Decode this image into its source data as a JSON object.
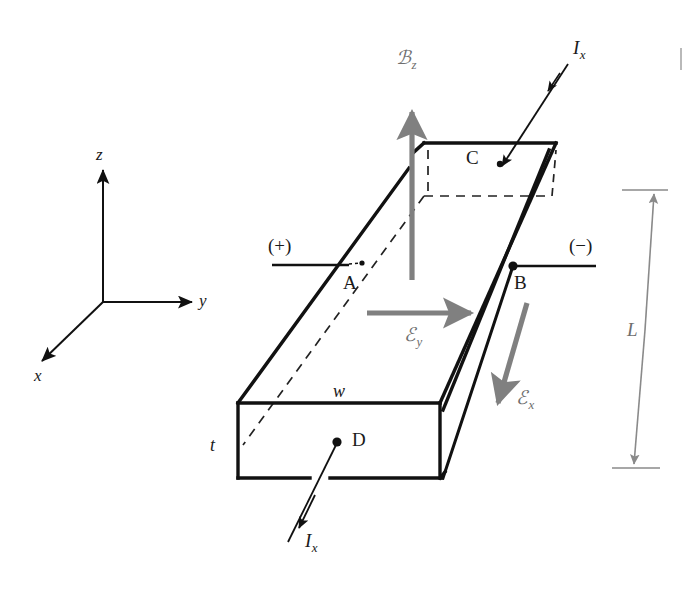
{
  "figure": {
    "background": "#ffffff",
    "width": 693,
    "height": 591
  },
  "colors": {
    "outline": "#111111",
    "hidden_edge": "#222222",
    "field_arrow": "#808080",
    "dimension": "#8a8a8a",
    "text": "#1a1a1a",
    "gray_text": "#6e6e6e"
  },
  "axes": {
    "name": "coordinate-axes",
    "origin": {
      "x": 103,
      "y": 302
    },
    "labels": {
      "z": "z",
      "y": "y",
      "x": "x"
    }
  },
  "bar": {
    "name": "conducting-bar",
    "dimension_labels": {
      "width": "w",
      "thickness": "t",
      "length": "L"
    }
  },
  "points": [
    {
      "id": "A",
      "label": "A",
      "x": 353,
      "y": 263,
      "marker": "small-dot"
    },
    {
      "id": "B",
      "label": "B",
      "x": 513,
      "y": 266,
      "marker": "dot"
    },
    {
      "id": "C",
      "label": "C",
      "x": 491,
      "y": 159,
      "marker": "arrow-target"
    },
    {
      "id": "D",
      "label": "D",
      "x": 337,
      "y": 442,
      "marker": "dot"
    }
  ],
  "terminals": [
    {
      "id": "positive",
      "label": "(+)",
      "side": "left"
    },
    {
      "id": "negative",
      "label": "(−)",
      "side": "right"
    }
  ],
  "fields": [
    {
      "id": "Bz",
      "symbol": "ℬ",
      "subscript": "z",
      "direction": "up",
      "color": "#808080"
    },
    {
      "id": "Ey",
      "symbol": "ℰ",
      "subscript": "y",
      "direction": "right",
      "color": "#808080"
    },
    {
      "id": "Ex",
      "symbol": "ℰ",
      "subscript": "x",
      "direction": "down",
      "color": "#808080"
    }
  ],
  "currents": [
    {
      "id": "Ix-top",
      "symbol": "I",
      "subscript": "x",
      "points_to": "C",
      "position": "top-right"
    },
    {
      "id": "Ix-bottom",
      "symbol": "I",
      "subscript": "x",
      "points_from": "D",
      "position": "bottom-left"
    }
  ]
}
